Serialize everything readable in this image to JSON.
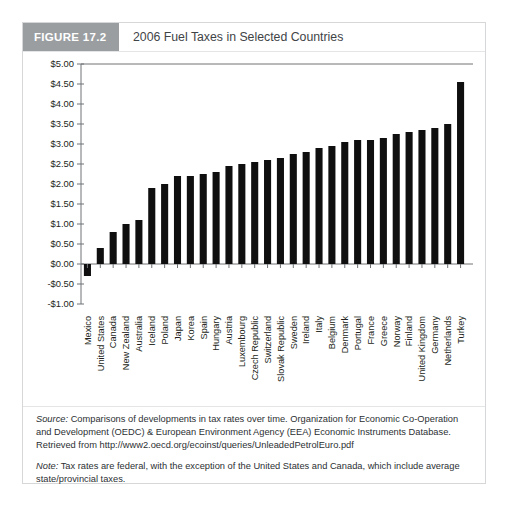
{
  "figure": {
    "number_label": "FIGURE 17.2",
    "title": "2006 Fuel Taxes in Selected Countries"
  },
  "notes": {
    "source_lead": "Source:",
    "source_text": " Comparisons of developments in tax rates over time. Organization for Economic Co-Operation and Development (OEDC) & European Environment Agency (EEA) Economic Instruments Database. Retrieved from http://www2.oecd.org/ecoinst/queries/UnleadedPetrolEuro.pdf",
    "note_lead": "Note:",
    "note_text": " Tax rates are federal, with the exception of the United States and Canada, which include average state/provincial taxes."
  },
  "chart_data": {
    "type": "bar",
    "title": "2006 Fuel Taxes in Selected Countries",
    "xlabel": "",
    "ylabel": "",
    "ylim": [
      -1.0,
      5.0
    ],
    "ytick_step": 0.5,
    "ytick_labels": [
      "$5.00",
      "$4.50",
      "$4.00",
      "$3.50",
      "$3.00",
      "$2.50",
      "$2.00",
      "$1.50",
      "$1.00",
      "$0.50",
      "$0.00",
      "-$0.50",
      "-$1.00"
    ],
    "ytick_values": [
      5.0,
      4.5,
      4.0,
      3.5,
      3.0,
      2.5,
      2.0,
      1.5,
      1.0,
      0.5,
      0.0,
      -0.5,
      -1.0
    ],
    "grid": false,
    "legend": "none",
    "bar_color": "#100f0f",
    "categories": [
      "Mexico",
      "United States",
      "Canada",
      "New Zealand",
      "Australia",
      "Iceland",
      "Poland",
      "Japan",
      "Korea",
      "Spain",
      "Hungary",
      "Austria",
      "Luxembourg",
      "Czech Republic",
      "Switzerland",
      "Slovak Republic",
      "Sweden",
      "Ireland",
      "Italy",
      "Belgium",
      "Denmark",
      "Portugal",
      "France",
      "Greece",
      "Norway",
      "Finland",
      "United Kingdom",
      "Germany",
      "Netherlands",
      "Turkey"
    ],
    "values": [
      -0.3,
      0.4,
      0.8,
      1.0,
      1.1,
      1.9,
      2.0,
      2.2,
      2.2,
      2.25,
      2.3,
      2.45,
      2.5,
      2.55,
      2.6,
      2.65,
      2.75,
      2.8,
      2.9,
      2.95,
      3.05,
      3.1,
      3.1,
      3.15,
      3.25,
      3.3,
      3.35,
      3.4,
      3.5,
      4.55
    ]
  }
}
